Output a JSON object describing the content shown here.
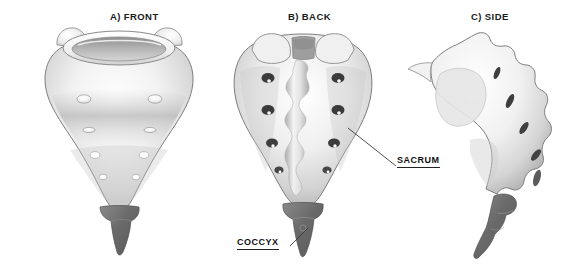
{
  "illustration": {
    "subject": "Sacrum and coccyx anatomy",
    "background_color": "#ffffff",
    "bone_color_light": "#fdfdfd",
    "bone_color_mid": "#c9c9c9",
    "bone_color_shadow": "#9a9a9a",
    "outline_color": "#6f6f6f",
    "coccyx_color": "#6d6d6d",
    "foramen_color": "#4a4a4a",
    "label_color": "#111111"
  },
  "panels": [
    {
      "id": "front",
      "title": "A) FRONT"
    },
    {
      "id": "back",
      "title": "B) BACK"
    },
    {
      "id": "side",
      "title": "C) SIDE"
    }
  ],
  "callouts": [
    {
      "id": "sacrum",
      "label": "SACRUM",
      "underlined": true,
      "points_to": "back-view-body"
    },
    {
      "id": "coccyx",
      "label": "COCCYX",
      "underlined": true,
      "points_to": "back-view-coccyx"
    }
  ]
}
